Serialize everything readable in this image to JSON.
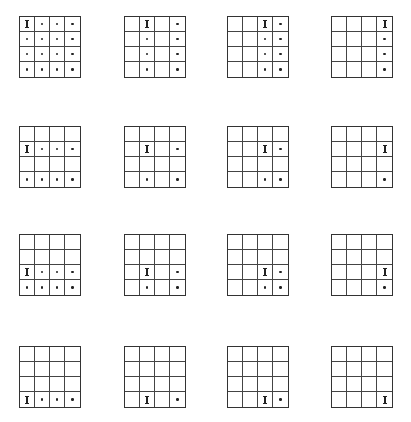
{
  "layout": {
    "col_x": [
      19,
      124,
      227,
      331
    ],
    "row_y": [
      16,
      126,
      234,
      346
    ],
    "grid_size": 4
  },
  "grids": [
    {
      "row": 0,
      "col": 0,
      "i": [
        0,
        0
      ],
      "dots": [
        [
          0,
          1
        ],
        [
          0,
          2
        ],
        [
          0,
          3
        ],
        [
          1,
          0
        ],
        [
          1,
          1
        ],
        [
          1,
          2
        ],
        [
          1,
          3
        ],
        [
          2,
          0
        ],
        [
          2,
          1
        ],
        [
          2,
          2
        ],
        [
          2,
          3
        ],
        [
          3,
          0
        ],
        [
          3,
          1
        ],
        [
          3,
          2
        ],
        [
          3,
          3
        ]
      ]
    },
    {
      "row": 0,
      "col": 1,
      "i": [
        0,
        1
      ],
      "dots": [
        [
          0,
          3
        ],
        [
          1,
          1
        ],
        [
          1,
          3
        ],
        [
          2,
          1
        ],
        [
          2,
          3
        ],
        [
          3,
          1
        ],
        [
          3,
          3
        ]
      ]
    },
    {
      "row": 0,
      "col": 2,
      "i": [
        0,
        2
      ],
      "dots": [
        [
          0,
          3
        ],
        [
          1,
          2
        ],
        [
          1,
          3
        ],
        [
          2,
          2
        ],
        [
          2,
          3
        ],
        [
          3,
          2
        ],
        [
          3,
          3
        ]
      ]
    },
    {
      "row": 0,
      "col": 3,
      "i": [
        0,
        3
      ],
      "dots": [
        [
          1,
          3
        ],
        [
          2,
          3
        ],
        [
          3,
          3
        ]
      ]
    },
    {
      "row": 1,
      "col": 0,
      "i": [
        1,
        0
      ],
      "dots": [
        [
          1,
          1
        ],
        [
          1,
          2
        ],
        [
          1,
          3
        ],
        [
          3,
          0
        ],
        [
          3,
          1
        ],
        [
          3,
          2
        ],
        [
          3,
          3
        ]
      ]
    },
    {
      "row": 1,
      "col": 1,
      "i": [
        1,
        1
      ],
      "dots": [
        [
          1,
          3
        ],
        [
          3,
          1
        ],
        [
          3,
          3
        ]
      ]
    },
    {
      "row": 1,
      "col": 2,
      "i": [
        1,
        2
      ],
      "dots": [
        [
          1,
          3
        ],
        [
          3,
          2
        ],
        [
          3,
          3
        ]
      ]
    },
    {
      "row": 1,
      "col": 3,
      "i": [
        1,
        3
      ],
      "dots": [
        [
          3,
          3
        ]
      ]
    },
    {
      "row": 2,
      "col": 0,
      "i": [
        2,
        0
      ],
      "dots": [
        [
          2,
          1
        ],
        [
          2,
          2
        ],
        [
          2,
          3
        ],
        [
          3,
          0
        ],
        [
          3,
          1
        ],
        [
          3,
          2
        ],
        [
          3,
          3
        ]
      ]
    },
    {
      "row": 2,
      "col": 1,
      "i": [
        2,
        1
      ],
      "dots": [
        [
          2,
          3
        ],
        [
          3,
          1
        ],
        [
          3,
          3
        ]
      ]
    },
    {
      "row": 2,
      "col": 2,
      "i": [
        2,
        2
      ],
      "dots": [
        [
          2,
          3
        ],
        [
          3,
          2
        ],
        [
          3,
          3
        ]
      ]
    },
    {
      "row": 2,
      "col": 3,
      "i": [
        2,
        3
      ],
      "dots": [
        [
          3,
          3
        ]
      ]
    },
    {
      "row": 3,
      "col": 0,
      "i": [
        3,
        0
      ],
      "dots": [
        [
          3,
          1
        ],
        [
          3,
          2
        ],
        [
          3,
          3
        ]
      ]
    },
    {
      "row": 3,
      "col": 1,
      "i": [
        3,
        1
      ],
      "dots": [
        [
          3,
          3
        ]
      ]
    },
    {
      "row": 3,
      "col": 2,
      "i": [
        3,
        2
      ],
      "dots": [
        [
          3,
          3
        ]
      ]
    },
    {
      "row": 3,
      "col": 3,
      "i": [
        3,
        3
      ],
      "dots": []
    }
  ],
  "colors": {
    "line": "#444444",
    "mark": "#222222",
    "background": "#ffffff"
  }
}
